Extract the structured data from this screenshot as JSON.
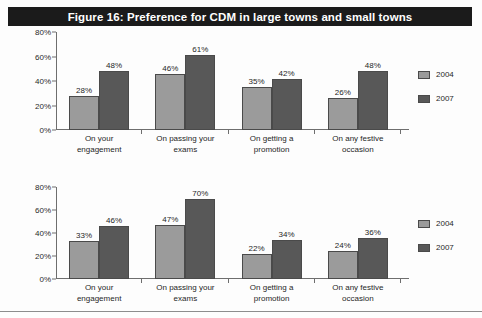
{
  "figure": {
    "title": "Figure 16: Preference for CDM in large towns and small towns",
    "title_bg": "#1b1b1b",
    "title_color": "#ffffff"
  },
  "colors": {
    "series_2004": "#9b9b9b",
    "series_2007": "#585858",
    "axis": "#6e6e6e",
    "background": "#fdfdfd"
  },
  "legend": {
    "items": [
      {
        "label": "2004",
        "color": "#9b9b9b"
      },
      {
        "label": "2007",
        "color": "#585858"
      }
    ]
  },
  "yticks": [
    "80%",
    "60%",
    "40%",
    "20%",
    "0%"
  ],
  "categories": [
    "On your\nengagement",
    "On passing your\nexams",
    "On getting a\npromotion",
    "On any festive\noccasion"
  ],
  "cat_lines": [
    [
      "On your",
      "engagement"
    ],
    [
      "On passing your",
      "exams"
    ],
    [
      "On getting a",
      "promotion"
    ],
    [
      "On any festive",
      "occasion"
    ]
  ],
  "chart_data": [
    {
      "type": "bar",
      "id": "large-towns",
      "title": "Preference for CDM in large towns",
      "categories": [
        "On your engagement",
        "On passing your exams",
        "On getting a promotion",
        "On any festive occasion"
      ],
      "series": [
        {
          "name": "2004",
          "values": [
            28,
            46,
            35,
            26
          ],
          "labels": [
            "28%",
            "46%",
            "35%",
            "26%"
          ]
        },
        {
          "name": "2007",
          "values": [
            48,
            61,
            42,
            48
          ],
          "labels": [
            "48%",
            "61%",
            "42%",
            "48%"
          ]
        }
      ],
      "xlabel": "",
      "ylabel": "",
      "ylim": [
        0,
        80
      ],
      "ytick_values": [
        0,
        20,
        40,
        60,
        80
      ],
      "ytick_labels": [
        "0%",
        "20%",
        "40%",
        "60%",
        "80%"
      ],
      "grid": false,
      "legend_position": "right",
      "data_labels": true
    },
    {
      "type": "bar",
      "id": "small-towns",
      "title": "Preference for CDM in small towns",
      "categories": [
        "On your engagement",
        "On passing your exams",
        "On getting a promotion",
        "On any festive occasion"
      ],
      "series": [
        {
          "name": "2004",
          "values": [
            33,
            47,
            22,
            24
          ],
          "labels": [
            "33%",
            "47%",
            "22%",
            "24%"
          ]
        },
        {
          "name": "2007",
          "values": [
            46,
            70,
            34,
            36
          ],
          "labels": [
            "46%",
            "70%",
            "34%",
            "36%"
          ]
        }
      ],
      "xlabel": "",
      "ylabel": "",
      "ylim": [
        0,
        80
      ],
      "ytick_values": [
        0,
        20,
        40,
        60,
        80
      ],
      "ytick_labels": [
        "0%",
        "20%",
        "40%",
        "60%",
        "80%"
      ],
      "grid": false,
      "legend_position": "right",
      "data_labels": true
    }
  ]
}
